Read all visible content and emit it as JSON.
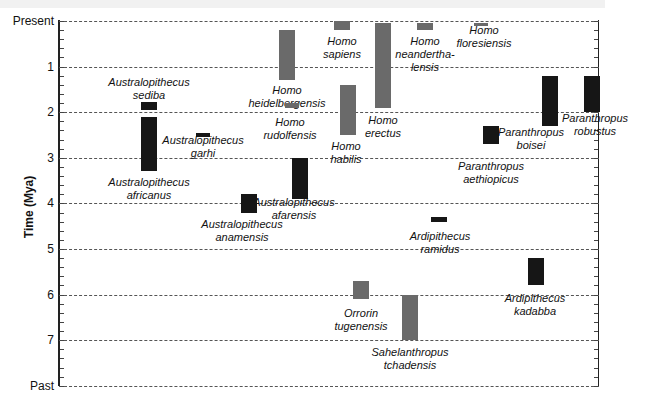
{
  "chart_data": {
    "type": "bar",
    "subtype": "floating-range (timeline)",
    "title": "",
    "xlabel": "",
    "ylabel": "Time (Mya)",
    "y_axis": {
      "inverted": true,
      "top_label": "Present",
      "bottom_label": "Past",
      "ticks": [
        "Present",
        "1",
        "2",
        "3",
        "4",
        "5",
        "6",
        "7",
        "Past"
      ],
      "ylim": [
        0,
        8
      ]
    },
    "grid": "horizontal dashed lines at each tick",
    "legend": null,
    "colors": {
      "australopith_paranthropus_ardipithecus": "#161616",
      "homo_and_earliest": "#6a6a6a"
    },
    "series": [
      {
        "name": "Homo heidelbergensis",
        "line1": "Homo",
        "line2": "heidelbergensis",
        "start": 1.3,
        "end": 0.2,
        "color": "gray"
      },
      {
        "name": "Homo rudolfensis",
        "line1": "Homo",
        "line2": "rudolfensis",
        "start": 1.9,
        "end": 1.8,
        "color": "gray"
      },
      {
        "name": "Homo sapiens",
        "line1": "Homo",
        "line2": "sapiens",
        "start": 0.2,
        "end": 0.0,
        "color": "gray"
      },
      {
        "name": "Homo habilis",
        "line1": "Homo",
        "line2": "habilis",
        "start": 2.5,
        "end": 1.4,
        "color": "gray"
      },
      {
        "name": "Homo erectus",
        "line1": "Homo",
        "line2": "erectus",
        "start": 1.9,
        "end": 0.05,
        "color": "gray"
      },
      {
        "name": "Homo neanderthalensis",
        "line1": "Homo",
        "line2": "neandertha-",
        "line3": "lensis",
        "start": 0.2,
        "end": 0.04,
        "color": "gray"
      },
      {
        "name": "Homo floresiensis",
        "line1": "Homo",
        "line2": "floresiensis",
        "start": 0.1,
        "end": 0.05,
        "color": "gray"
      },
      {
        "name": "Australopithecus sediba",
        "line1": "Australopithecus",
        "line2": "sediba",
        "start": 1.95,
        "end": 1.78,
        "color": "black"
      },
      {
        "name": "Australopithecus africanus",
        "line1": "Australopithecus",
        "line2": "africanus",
        "start": 3.3,
        "end": 2.1,
        "color": "black"
      },
      {
        "name": "Australopithecus garhi",
        "line1": "Australopithecus",
        "line2": "garhi",
        "start": 2.55,
        "end": 2.45,
        "color": "black"
      },
      {
        "name": "Australopithecus afarensis",
        "line1": "Australopithecus",
        "line2": "afarensis",
        "start": 3.9,
        "end": 3.0,
        "color": "black"
      },
      {
        "name": "Australopithecus anamensis",
        "line1": "Australopithecus",
        "line2": "anamensis",
        "start": 4.2,
        "end": 3.8,
        "color": "black"
      },
      {
        "name": "Paranthropus aethiopicus",
        "line1": "Paranthropus",
        "line2": "aethiopicus",
        "start": 2.7,
        "end": 2.3,
        "color": "black"
      },
      {
        "name": "Paranthropus boisei",
        "line1": "Paranthropus",
        "line2": "boisei",
        "start": 2.3,
        "end": 1.2,
        "color": "black"
      },
      {
        "name": "Paranthropus robustus",
        "line1": "Paranthropus",
        "line2": "robustus",
        "start": 2.0,
        "end": 1.2,
        "color": "black"
      },
      {
        "name": "Ardipithecus ramidus",
        "line1": "Ardipithecus",
        "line2": "ramidus",
        "start": 4.4,
        "end": 4.3,
        "color": "black"
      },
      {
        "name": "Ardipithecus kadabba",
        "line1": "Ardipithecus",
        "line2": "kadabba",
        "start": 5.8,
        "end": 5.2,
        "color": "black"
      },
      {
        "name": "Orrorin tugenensis",
        "line1": "Orrorin",
        "line2": "tugenensis",
        "start": 6.1,
        "end": 5.7,
        "color": "gray"
      },
      {
        "name": "Sahelanthropus tchadensis",
        "line1": "Sahelanthropus",
        "line2": "tchadensis",
        "start": 7.0,
        "end": 6.0,
        "color": "gray"
      }
    ]
  }
}
